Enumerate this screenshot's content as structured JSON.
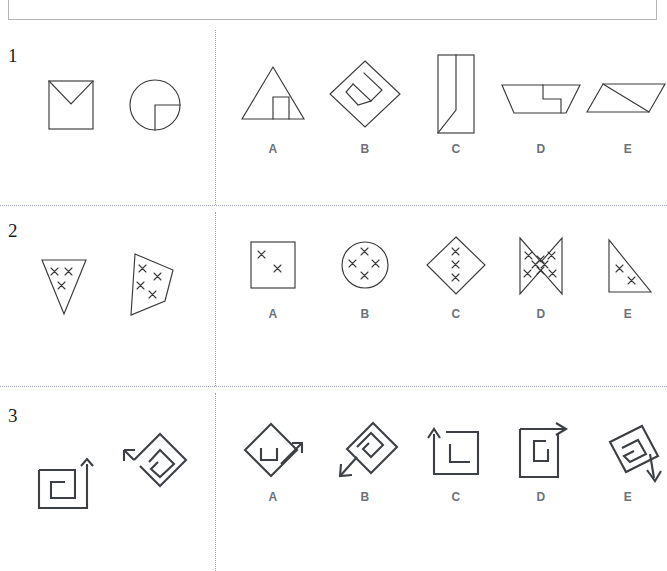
{
  "header": {
    "instruction": ""
  },
  "layout": {
    "divider_color": "#9aa0b0",
    "stroke_color": "#3a3a3a",
    "label_color": "#6d7278",
    "background": "#ffffff",
    "vertical_divider_x": 215
  },
  "rows": [
    {
      "number": "1",
      "stimuli": [
        {
          "name": "square-with-v-flap",
          "description": "Square containing a V shape from upper corners to center"
        },
        {
          "name": "circle-with-quarter-wedge",
          "description": "Circle with a quarter sector outlined at lower right"
        }
      ],
      "options": [
        {
          "letter": "A",
          "name": "triangle-with-inner-notch",
          "description": "Triangle with a small notched rectangle inside near the base"
        },
        {
          "letter": "B",
          "name": "diamond-with-inner-diamond-notch",
          "description": "Diamond containing an offset inner diamond with a notch"
        },
        {
          "letter": "C",
          "name": "tall-rectangle-with-diagonal-fold",
          "description": "Tall rectangle with a diagonal fold line"
        },
        {
          "letter": "D",
          "name": "trapezoid-with-inner-step",
          "description": "Wide trapezoid with a small inner stepped rectangle"
        },
        {
          "letter": "E",
          "name": "parallelogram-with-diagonal",
          "description": "Parallelogram crossed by a diagonal line"
        }
      ]
    },
    {
      "number": "2",
      "stimuli": [
        {
          "name": "inverted-triangle-three-x",
          "description": "Downward triangle containing 3 x marks",
          "x_count": 3
        },
        {
          "name": "quadrilateral-four-x",
          "description": "Irregular quadrilateral containing 4 x marks",
          "x_count": 4
        }
      ],
      "options": [
        {
          "letter": "A",
          "name": "square-two-x",
          "description": "Square containing 2 x marks",
          "x_count": 2
        },
        {
          "letter": "B",
          "name": "circle-four-x",
          "description": "Circle containing 4 x marks",
          "x_count": 4
        },
        {
          "letter": "C",
          "name": "diamond-three-x",
          "description": "Diamond containing 3 stacked x marks",
          "x_count": 3
        },
        {
          "letter": "D",
          "name": "bowtie-eight-x",
          "description": "Bowtie shape containing 8 x marks",
          "x_count": 8
        },
        {
          "letter": "E",
          "name": "right-triangle-two-x",
          "description": "Right triangle containing 2 x marks",
          "x_count": 2
        }
      ]
    },
    {
      "number": "3",
      "stimuli": [
        {
          "name": "square-spiral-up-arrow",
          "description": "Square spiral with an arrow pointing up"
        },
        {
          "name": "rotated-diamond-spiral-arrow",
          "description": "Rotated diamond spiral with an arrow pointing up-left"
        }
      ],
      "options": [
        {
          "letter": "A",
          "name": "diamond-spiral-arrow-upright",
          "description": "Diamond outline with inner hook and arrow pointing up-right"
        },
        {
          "letter": "B",
          "name": "rotated-spiral-arrow-downleft",
          "description": "Rotated square spiral with arrow pointing down-left"
        },
        {
          "letter": "C",
          "name": "square-spiral-arrow-up-left",
          "description": "Square spiral with arrow pointing up at left side"
        },
        {
          "letter": "D",
          "name": "square-spiral-arrow-up-right",
          "description": "Square spiral with arrow pointing right at top"
        },
        {
          "letter": "E",
          "name": "tilted-square-spiral-arrow-down",
          "description": "Tilted square spiral with arrow pointing down-right"
        }
      ]
    }
  ]
}
